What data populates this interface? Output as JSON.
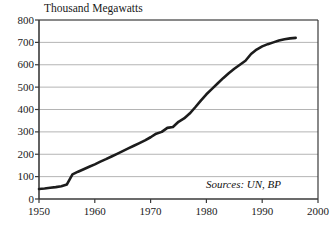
{
  "chart_data": {
    "type": "line",
    "title": "Thousand Megawatts",
    "xlabel": "",
    "ylabel": "",
    "xlim": [
      1950,
      2000
    ],
    "ylim": [
      0,
      800
    ],
    "grid": true,
    "legend": null,
    "annotations": [
      "Sources: UN, BP"
    ],
    "xticks": [
      1950,
      1960,
      1970,
      1980,
      1990,
      2000
    ],
    "yticks": [
      0,
      100,
      200,
      300,
      400,
      500,
      600,
      700,
      800
    ],
    "series": [
      {
        "name": "Installed nuclear capacity",
        "x": [
          1950,
          1951,
          1952,
          1953,
          1954,
          1955,
          1956,
          1957,
          1958,
          1959,
          1960,
          1961,
          1962,
          1963,
          1964,
          1965,
          1966,
          1967,
          1968,
          1969,
          1970,
          1971,
          1972,
          1973,
          1974,
          1975,
          1976,
          1977,
          1978,
          1979,
          1980,
          1981,
          1982,
          1983,
          1984,
          1985,
          1986,
          1987,
          1988,
          1989,
          1990,
          1991,
          1992,
          1993,
          1994,
          1995,
          1996
        ],
        "values": [
          45,
          47,
          50,
          53,
          57,
          65,
          110,
          122,
          133,
          144,
          155,
          167,
          178,
          190,
          202,
          214,
          226,
          238,
          250,
          262,
          276,
          292,
          300,
          318,
          322,
          345,
          360,
          382,
          410,
          440,
          468,
          492,
          516,
          540,
          562,
          582,
          600,
          618,
          648,
          668,
          682,
          692,
          700,
          708,
          714,
          718,
          720
        ]
      }
    ]
  },
  "axis": {
    "ytick_labels": [
      "800",
      "700",
      "600",
      "500",
      "400",
      "300",
      "200",
      "100",
      "0"
    ],
    "xtick_labels": [
      "1950",
      "1960",
      "1970",
      "1980",
      "1990",
      "2000"
    ]
  },
  "source_note": "Sources: UN, BP",
  "colors": {
    "line": "#1c1c1c",
    "axis": "#3a3a3a",
    "grid": "#b4b4b4",
    "text": "#1a1a1a",
    "background": "#ffffff"
  }
}
